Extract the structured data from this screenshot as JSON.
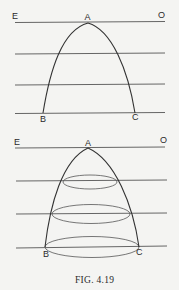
{
  "figure": {
    "caption": "Fig. 4.19",
    "caption_display": "FIG. 4.19"
  },
  "top_diagram": {
    "labels": {
      "E": "E",
      "A": "A",
      "O": "O",
      "B": "B",
      "C": "C"
    },
    "horizontal_lines": 4,
    "description": "Parabolic curve with vertex A on line EO, cut by parallel horizontal lines, ending at B and C"
  },
  "bottom_diagram": {
    "labels": {
      "E": "E",
      "A": "A",
      "O": "O",
      "B": "B",
      "C": "C"
    },
    "horizontal_lines": 4,
    "ellipse_sections": 3,
    "description": "Paraboloid of revolution with vertex A, elliptical cross-sections at each horizontal line, base BC"
  },
  "colors": {
    "background": "#f4f4f2",
    "line": "#555555",
    "curve": "#333333",
    "text": "#2a2a2a"
  }
}
